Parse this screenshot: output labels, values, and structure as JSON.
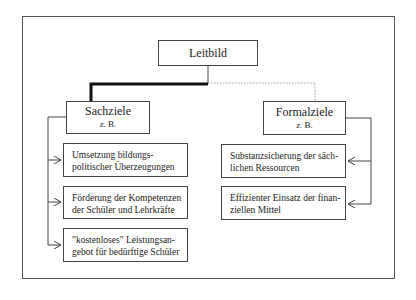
{
  "diagram": {
    "root": {
      "label": "Leitbild"
    },
    "branches": [
      {
        "label": "Sachziele",
        "sublabel": "z. B.",
        "connector_style": "thick-solid",
        "items": [
          {
            "line1": "Umsetzung bildungs-",
            "line2": "politischer Überzeugungen"
          },
          {
            "line1": "Förderung der Kompetenzen",
            "line2": "der Schüler und Lehrkräfte"
          },
          {
            "line1": "\"kostenloses\" Leistungsan-",
            "line2": "gebot für bedürftige Schüler"
          }
        ]
      },
      {
        "label": "Formalziele",
        "sublabel": "z. B.",
        "connector_style": "thin-dotted",
        "items": [
          {
            "line1": "Substanzsicherung der säch-",
            "line2": "lichen Ressourcen"
          },
          {
            "line1": "Effizienter Einsatz der finan-",
            "line2": "ziellen Mittel"
          }
        ]
      }
    ],
    "colors": {
      "line": "#444444",
      "thick_line": "#111111",
      "dotted_line": "#999999",
      "background": "#ffffff"
    }
  }
}
